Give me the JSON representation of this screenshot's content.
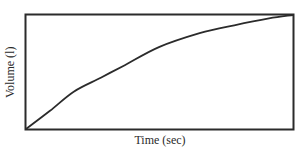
{
  "chart_data": {
    "type": "line",
    "title": "",
    "xlabel": "Time (sec)",
    "ylabel": "Volume (l)",
    "xlim": [
      0,
      100
    ],
    "ylim": [
      0,
      100
    ],
    "grid": false,
    "legend": null,
    "ticks": "none",
    "series": [
      {
        "name": "Volume",
        "x": [
          0,
          9,
          18,
          28,
          37,
          50,
          65,
          78,
          91,
          100
        ],
        "y": [
          0,
          16,
          33,
          45,
          56,
          72,
          84,
          91,
          97,
          100
        ]
      }
    ],
    "colors": {
      "line": "#2b2b2b",
      "frame": "#2b2b2b",
      "background": "#ffffff"
    }
  },
  "labels": {
    "x": "Time (sec)",
    "y": "Volume (l)"
  }
}
